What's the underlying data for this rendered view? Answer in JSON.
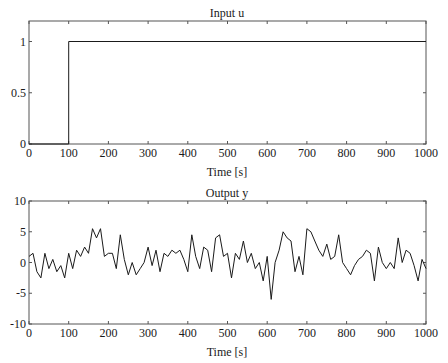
{
  "chart_data": [
    {
      "type": "line",
      "title": "Input u",
      "xlabel": "Time [s]",
      "ylabel": "",
      "xlim": [
        0,
        1000
      ],
      "ylim": [
        0,
        1.2
      ],
      "xticks": [
        0,
        100,
        200,
        300,
        400,
        500,
        600,
        700,
        800,
        900,
        1000
      ],
      "yticks": [
        0,
        0.5,
        1
      ],
      "grid": false,
      "legend": null,
      "series": [
        {
          "name": "u",
          "x": [
            0,
            100,
            100,
            1000
          ],
          "values": [
            0,
            0,
            1,
            1
          ]
        }
      ]
    },
    {
      "type": "line",
      "title": "Output y",
      "xlabel": "Time [s]",
      "ylabel": "",
      "xlim": [
        0,
        1000
      ],
      "ylim": [
        -10,
        10
      ],
      "xticks": [
        0,
        100,
        200,
        300,
        400,
        500,
        600,
        700,
        800,
        900,
        1000
      ],
      "yticks": [
        -10,
        -5,
        0,
        5,
        10
      ],
      "grid": false,
      "legend": null,
      "series": [
        {
          "name": "y",
          "x": [
            0,
            10,
            20,
            30,
            40,
            50,
            60,
            70,
            80,
            90,
            100,
            110,
            120,
            130,
            140,
            150,
            160,
            170,
            180,
            190,
            200,
            210,
            220,
            230,
            240,
            250,
            260,
            270,
            280,
            290,
            300,
            310,
            320,
            330,
            340,
            350,
            360,
            370,
            380,
            390,
            400,
            410,
            420,
            430,
            440,
            450,
            460,
            470,
            480,
            490,
            500,
            510,
            520,
            530,
            540,
            550,
            560,
            570,
            580,
            590,
            600,
            610,
            620,
            630,
            640,
            650,
            660,
            670,
            680,
            690,
            700,
            710,
            720,
            730,
            740,
            750,
            760,
            770,
            780,
            790,
            800,
            810,
            820,
            830,
            840,
            850,
            860,
            870,
            880,
            890,
            900,
            910,
            920,
            930,
            940,
            950,
            960,
            970,
            980,
            990,
            1000
          ],
          "values": [
            1,
            1.5,
            -1.5,
            -2.5,
            1.5,
            -1,
            0.5,
            -1.5,
            -0.5,
            -2.5,
            1.5,
            -1,
            2,
            1,
            2.5,
            1.5,
            5.5,
            4,
            5.5,
            1,
            1.5,
            1.5,
            -1,
            4.5,
            0.5,
            -2,
            0,
            -2,
            -1,
            0,
            2.5,
            -0.5,
            2,
            -1.5,
            1.5,
            1,
            2,
            1.5,
            2,
            0.5,
            -1.5,
            4.5,
            1,
            -1,
            2.5,
            2,
            -1.5,
            4,
            4.5,
            1,
            1.5,
            -2.5,
            1.5,
            0.5,
            3.5,
            0,
            1.5,
            -1,
            0,
            -3,
            1,
            -6,
            0,
            2,
            5,
            4,
            3.5,
            -1.5,
            1,
            -2,
            5.5,
            5,
            3.5,
            2,
            1,
            3,
            0.5,
            1,
            4.5,
            0,
            -1,
            -2,
            -0.5,
            0.5,
            1,
            2,
            1.5,
            -3,
            2.5,
            0,
            -1,
            0,
            -1,
            4,
            0,
            2,
            1.5,
            -0.5,
            -3,
            0.5,
            -1
          ]
        }
      ]
    }
  ],
  "plots": {
    "top": {
      "title": "Input u",
      "xlabel": "Time [s]",
      "xtick_labels": [
        "0",
        "100",
        "200",
        "300",
        "400",
        "500",
        "600",
        "700",
        "800",
        "900",
        "1000"
      ],
      "ytick_labels": [
        "0",
        "0.5",
        "1"
      ]
    },
    "bottom": {
      "title": "Output y",
      "xlabel": "Time [s]",
      "xtick_labels": [
        "0",
        "100",
        "200",
        "300",
        "400",
        "500",
        "600",
        "700",
        "800",
        "900",
        "1000"
      ],
      "ytick_labels": [
        "-10",
        "-5",
        "0",
        "5",
        "10"
      ]
    }
  },
  "colors": {
    "line": "#1a1a1a",
    "axes": "#555555",
    "background": "#ffffff"
  }
}
